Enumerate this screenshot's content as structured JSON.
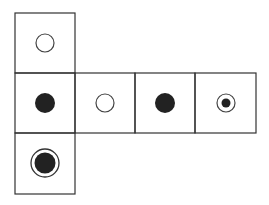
{
  "diagram": {
    "type": "cube-net",
    "cell_size": 60,
    "stroke_color": "#333333",
    "fill_color": "#222222",
    "cells": [
      {
        "row": 0,
        "col": 0,
        "symbol": "hollow-circle"
      },
      {
        "row": 1,
        "col": 0,
        "symbol": "filled-circle"
      },
      {
        "row": 1,
        "col": 1,
        "symbol": "hollow-circle"
      },
      {
        "row": 1,
        "col": 2,
        "symbol": "filled-circle"
      },
      {
        "row": 1,
        "col": 3,
        "symbol": "dot-in-ring"
      },
      {
        "row": 2,
        "col": 0,
        "symbol": "filled-circle-in-ring"
      }
    ]
  }
}
